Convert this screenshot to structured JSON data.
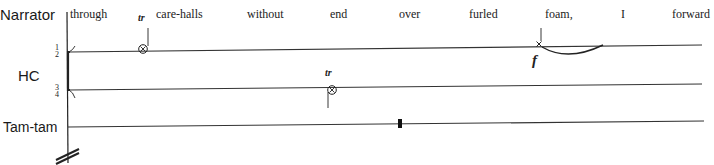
{
  "score": {
    "instruments": [
      {
        "name": "Narrator"
      },
      {
        "name": "HC"
      },
      {
        "name": "Tam-tam"
      }
    ],
    "hc_staff_labels": {
      "upper": {
        "num": "1",
        "den": "2"
      },
      "lower": {
        "num": "3",
        "den": "4"
      }
    },
    "narrator_text": [
      "through",
      "care-halls",
      "without",
      "end",
      "over",
      "furled",
      "foam,",
      "I",
      "forward"
    ],
    "markings": {
      "trill_1": "tr",
      "trill_2": "tr",
      "dynamic": "f"
    },
    "colors": {
      "ink": "#222222",
      "background": "#ffffff"
    }
  }
}
